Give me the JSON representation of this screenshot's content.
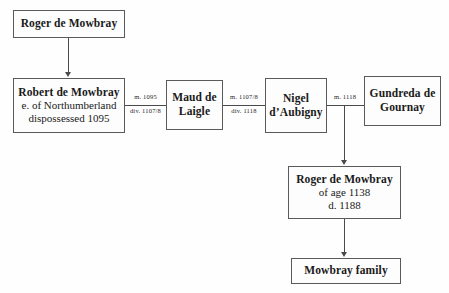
{
  "diagram": {
    "ink_color": "#4a4a4a",
    "background_color": "#fefefe",
    "nodes": [
      {
        "id": "roger-de-mowbray-elder",
        "lines": [
          {
            "text": "Roger de Mowbray",
            "bold": true
          }
        ]
      },
      {
        "id": "robert-de-mowbray",
        "lines": [
          {
            "text": "Robert de Mowbray",
            "bold": true
          },
          {
            "text": "e. of Northumberland",
            "bold": false
          },
          {
            "text": "dispossessed 1095",
            "bold": false
          }
        ]
      },
      {
        "id": "maud-de-laigle",
        "lines": [
          {
            "text": "Maud de",
            "bold": true
          },
          {
            "text": "Laigle",
            "bold": true
          }
        ]
      },
      {
        "id": "nigel-daubigny",
        "lines": [
          {
            "text": "Nigel",
            "bold": true
          },
          {
            "text": "d’Aubigny",
            "bold": true
          }
        ]
      },
      {
        "id": "gundreda-de-gournay",
        "lines": [
          {
            "text": "Gundreda de",
            "bold": true
          },
          {
            "text": "Gournay",
            "bold": true
          }
        ]
      },
      {
        "id": "roger-de-mowbray-younger",
        "lines": [
          {
            "text": "Roger de Mowbray",
            "bold": true
          },
          {
            "text": "of age 1138",
            "bold": false
          },
          {
            "text": "d. 1188",
            "bold": false
          }
        ]
      },
      {
        "id": "mowbray-family",
        "lines": [
          {
            "text": "Mowbray family",
            "bold": true
          }
        ]
      }
    ],
    "marriage_labels": [
      {
        "id": "robert-maud-marriage",
        "married": "m. 1095",
        "divorced": "div. 1107/8"
      },
      {
        "id": "maud-nigel-marriage",
        "married": "m. 1107/8",
        "divorced": "div. 1118"
      },
      {
        "id": "nigel-gundreda-marriage",
        "married": "m. 1118",
        "divorced": ""
      }
    ]
  }
}
